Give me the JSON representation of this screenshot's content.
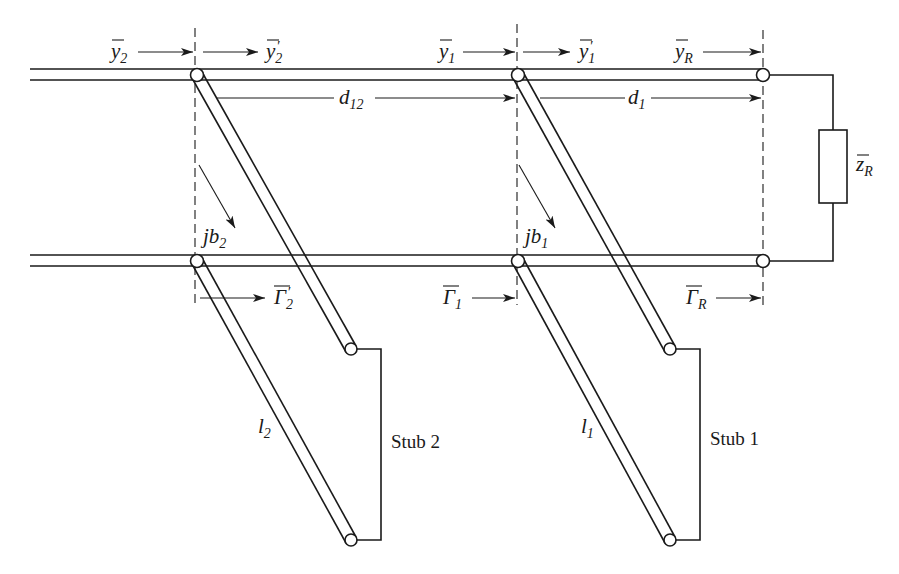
{
  "diagram": {
    "colors": {
      "ink": "#1a1a1a",
      "background": "#ffffff"
    },
    "labels": {
      "y2": {
        "base": "y",
        "sub": "2"
      },
      "y2p": {
        "base": "y",
        "sub": "2",
        "prime": "′"
      },
      "y1": {
        "base": "y",
        "sub": "1"
      },
      "y1p": {
        "base": "y",
        "sub": "1",
        "prime": "′"
      },
      "yR": {
        "base": "y",
        "sub": "R"
      },
      "d12": {
        "base": "d",
        "sub": "12"
      },
      "d1": {
        "base": "d",
        "sub": "1"
      },
      "zR": {
        "base": "z",
        "sub": "R"
      },
      "jb2": {
        "base": "jb",
        "sub": "2"
      },
      "jb1": {
        "base": "jb",
        "sub": "1"
      },
      "G2p": {
        "base": "Γ",
        "sub": "2",
        "prime": "′"
      },
      "G1": {
        "base": "Γ",
        "sub": "1"
      },
      "GR": {
        "base": "Γ",
        "sub": "R"
      },
      "l2": {
        "base": "l",
        "sub": "2"
      },
      "l1": {
        "base": "l",
        "sub": "1"
      },
      "stub2": "Stub 2",
      "stub1": "Stub 1"
    }
  }
}
